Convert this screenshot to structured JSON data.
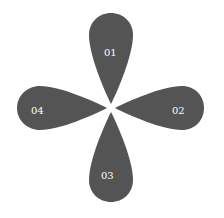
{
  "diagram": {
    "type": "four-petal",
    "fill_color": "#545454",
    "label_color": "#ffffff",
    "petals": [
      {
        "label": "01",
        "direction": "top"
      },
      {
        "label": "02",
        "direction": "right"
      },
      {
        "label": "03",
        "direction": "bottom"
      },
      {
        "label": "04",
        "direction": "left"
      }
    ]
  }
}
